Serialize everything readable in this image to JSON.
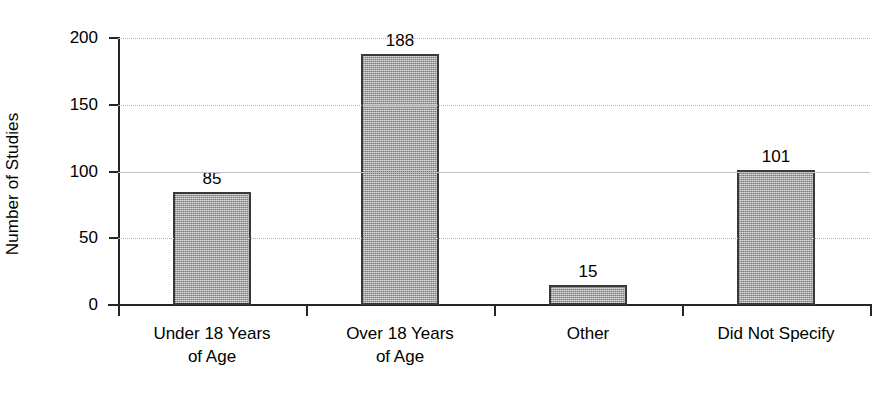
{
  "chart_data": {
    "type": "bar",
    "title": "",
    "xlabel": "",
    "ylabel": "Number of Studies",
    "categories": [
      "Under 18 Years of Age",
      "Over 18 Years of Age",
      "Other",
      "Did Not Specify"
    ],
    "category_lines": [
      [
        "Under 18 Years",
        "of Age"
      ],
      [
        "Over 18 Years",
        "of Age"
      ],
      [
        "Other",
        ""
      ],
      [
        "Did Not Specify",
        ""
      ]
    ],
    "values": [
      85,
      188,
      15,
      101
    ],
    "value_labels": [
      "85",
      "188",
      "15",
      "101"
    ],
    "ylim": [
      0,
      200
    ],
    "yticks": [
      0,
      50,
      100,
      150,
      200
    ],
    "ytick_labels": [
      "0",
      "50",
      "100",
      "150",
      "200"
    ],
    "grid": true,
    "legend": false,
    "bar_color": "#a3a3a3",
    "bar_border_color": "#3a3a3a",
    "gridline_color": "#b5b5b5",
    "axis_color": "#262626",
    "background_color": "#ffffff"
  }
}
